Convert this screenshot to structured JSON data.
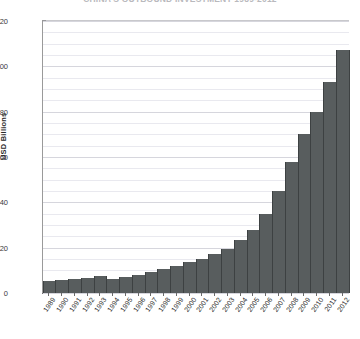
{
  "chart_data": {
    "type": "bar",
    "title": "CHINA'S OUTBOUND INVESTMENT 1989-2012",
    "title_clipped": true,
    "xlabel": "",
    "ylabel": "USD Billions",
    "ylim": [
      0,
      120
    ],
    "yticks": [
      0,
      20,
      40,
      60,
      80,
      100,
      120
    ],
    "ytick_labels": [
      "0",
      "20",
      "40",
      "60",
      "80",
      "100",
      "120"
    ],
    "grid": true,
    "grid_minor": true,
    "legend": "none",
    "series_color": "#585d5e",
    "categories": [
      "1989",
      "1990",
      "1991",
      "1992",
      "1993",
      "1994",
      "1995",
      "1996",
      "1997",
      "1998",
      "1999",
      "2000",
      "2001",
      "2002",
      "2003",
      "2004",
      "2005",
      "2006",
      "2007",
      "2008",
      "2009",
      "2010",
      "2011",
      "2012"
    ],
    "values": [
      5.5,
      5.8,
      6.2,
      6.8,
      7.3,
      6.3,
      7.1,
      8.0,
      9.2,
      10.5,
      12.0,
      13.5,
      15.0,
      17.0,
      19.5,
      23.5,
      28.0,
      35.0,
      45.0,
      58.0,
      70.0,
      80.0,
      93.0,
      107.0
    ]
  },
  "axis": {
    "y_axis_title": "USD Billions"
  }
}
